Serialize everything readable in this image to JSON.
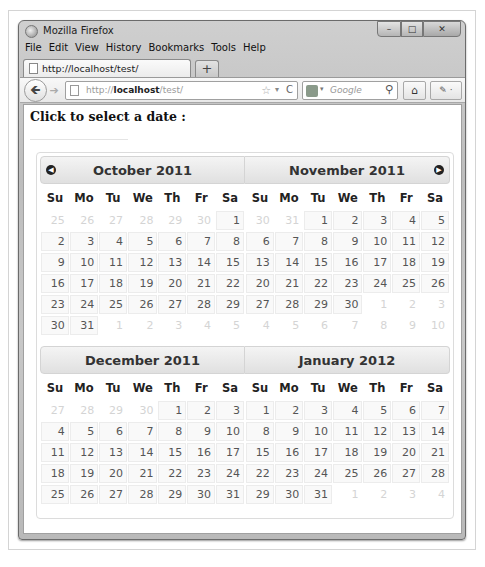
{
  "window": {
    "title": "Mozilla Firefox",
    "controls": {
      "minimize": "–",
      "maximize": "□",
      "close": "✕"
    }
  },
  "menu": [
    {
      "label": "File",
      "accel": "F"
    },
    {
      "label": "Edit",
      "accel": "E"
    },
    {
      "label": "View",
      "accel": "V"
    },
    {
      "label": "History",
      "accel": "s"
    },
    {
      "label": "Bookmarks",
      "accel": "B"
    },
    {
      "label": "Tools",
      "accel": "T"
    },
    {
      "label": "Help",
      "accel": "H"
    }
  ],
  "menu_labels": {
    "file": "File",
    "edit": "Edit",
    "view": "View",
    "history": "History",
    "bookmarks": "Bookmarks",
    "tools": "Tools",
    "help": "Help"
  },
  "tab": {
    "title": "http://localhost/test/",
    "new_tab": "+"
  },
  "navbar": {
    "back": "🡸",
    "forward": "➔",
    "url_prefix": "http://",
    "url_host": "localhost",
    "url_path": "/test/",
    "star": "☆",
    "dropdown": "▾",
    "reload": "C",
    "search_placeholder": "Google",
    "search_dropdown": "▾",
    "search_icon": "⚲",
    "home_icon": "⌂",
    "addon_label": "✎ ·"
  },
  "page": {
    "heading": "Click to select a date :"
  },
  "datepicker": {
    "prev_icon": "◀",
    "next_icon": "▶",
    "weekdays": [
      "Su",
      "Mo",
      "Tu",
      "We",
      "Th",
      "Fr",
      "Sa"
    ],
    "months": [
      {
        "title": "October 2011",
        "weeks": [
          [
            {
              "d": "25",
              "o": true
            },
            {
              "d": "26",
              "o": true
            },
            {
              "d": "27",
              "o": true
            },
            {
              "d": "28",
              "o": true
            },
            {
              "d": "29",
              "o": true
            },
            {
              "d": "30",
              "o": true
            },
            {
              "d": "1"
            }
          ],
          [
            {
              "d": "2"
            },
            {
              "d": "3"
            },
            {
              "d": "4"
            },
            {
              "d": "5"
            },
            {
              "d": "6"
            },
            {
              "d": "7"
            },
            {
              "d": "8"
            }
          ],
          [
            {
              "d": "9"
            },
            {
              "d": "10"
            },
            {
              "d": "11"
            },
            {
              "d": "12"
            },
            {
              "d": "13"
            },
            {
              "d": "14"
            },
            {
              "d": "15"
            }
          ],
          [
            {
              "d": "16"
            },
            {
              "d": "17"
            },
            {
              "d": "18"
            },
            {
              "d": "19"
            },
            {
              "d": "20"
            },
            {
              "d": "21"
            },
            {
              "d": "22"
            }
          ],
          [
            {
              "d": "23"
            },
            {
              "d": "24"
            },
            {
              "d": "25"
            },
            {
              "d": "26"
            },
            {
              "d": "27"
            },
            {
              "d": "28"
            },
            {
              "d": "29"
            }
          ],
          [
            {
              "d": "30"
            },
            {
              "d": "31"
            },
            {
              "d": "1",
              "o": true
            },
            {
              "d": "2",
              "o": true
            },
            {
              "d": "3",
              "o": true
            },
            {
              "d": "4",
              "o": true
            },
            {
              "d": "5",
              "o": true
            }
          ]
        ]
      },
      {
        "title": "November 2011",
        "weeks": [
          [
            {
              "d": "30",
              "o": true
            },
            {
              "d": "31",
              "o": true
            },
            {
              "d": "1"
            },
            {
              "d": "2"
            },
            {
              "d": "3"
            },
            {
              "d": "4"
            },
            {
              "d": "5"
            }
          ],
          [
            {
              "d": "6"
            },
            {
              "d": "7"
            },
            {
              "d": "8"
            },
            {
              "d": "9"
            },
            {
              "d": "10"
            },
            {
              "d": "11"
            },
            {
              "d": "12"
            }
          ],
          [
            {
              "d": "13"
            },
            {
              "d": "14"
            },
            {
              "d": "15"
            },
            {
              "d": "16"
            },
            {
              "d": "17"
            },
            {
              "d": "18"
            },
            {
              "d": "19"
            }
          ],
          [
            {
              "d": "20"
            },
            {
              "d": "21"
            },
            {
              "d": "22"
            },
            {
              "d": "23"
            },
            {
              "d": "24"
            },
            {
              "d": "25"
            },
            {
              "d": "26"
            }
          ],
          [
            {
              "d": "27"
            },
            {
              "d": "28"
            },
            {
              "d": "29"
            },
            {
              "d": "30"
            },
            {
              "d": "1",
              "o": true
            },
            {
              "d": "2",
              "o": true
            },
            {
              "d": "3",
              "o": true
            }
          ],
          [
            {
              "d": "4",
              "o": true
            },
            {
              "d": "5",
              "o": true
            },
            {
              "d": "6",
              "o": true
            },
            {
              "d": "7",
              "o": true
            },
            {
              "d": "8",
              "o": true
            },
            {
              "d": "9",
              "o": true
            },
            {
              "d": "10",
              "o": true
            }
          ]
        ]
      },
      {
        "title": "December 2011",
        "weeks": [
          [
            {
              "d": "27",
              "o": true
            },
            {
              "d": "28",
              "o": true
            },
            {
              "d": "29",
              "o": true
            },
            {
              "d": "30",
              "o": true
            },
            {
              "d": "1"
            },
            {
              "d": "2"
            },
            {
              "d": "3"
            }
          ],
          [
            {
              "d": "4"
            },
            {
              "d": "5"
            },
            {
              "d": "6"
            },
            {
              "d": "7"
            },
            {
              "d": "8"
            },
            {
              "d": "9"
            },
            {
              "d": "10"
            }
          ],
          [
            {
              "d": "11"
            },
            {
              "d": "12"
            },
            {
              "d": "13"
            },
            {
              "d": "14"
            },
            {
              "d": "15"
            },
            {
              "d": "16"
            },
            {
              "d": "17"
            }
          ],
          [
            {
              "d": "18"
            },
            {
              "d": "19"
            },
            {
              "d": "20"
            },
            {
              "d": "21"
            },
            {
              "d": "22"
            },
            {
              "d": "23"
            },
            {
              "d": "24"
            }
          ],
          [
            {
              "d": "25"
            },
            {
              "d": "26"
            },
            {
              "d": "27"
            },
            {
              "d": "28"
            },
            {
              "d": "29"
            },
            {
              "d": "30"
            },
            {
              "d": "31"
            }
          ]
        ]
      },
      {
        "title": "January 2012",
        "weeks": [
          [
            {
              "d": "1"
            },
            {
              "d": "2"
            },
            {
              "d": "3"
            },
            {
              "d": "4"
            },
            {
              "d": "5"
            },
            {
              "d": "6"
            },
            {
              "d": "7"
            }
          ],
          [
            {
              "d": "8"
            },
            {
              "d": "9"
            },
            {
              "d": "10"
            },
            {
              "d": "11"
            },
            {
              "d": "12"
            },
            {
              "d": "13"
            },
            {
              "d": "14"
            }
          ],
          [
            {
              "d": "15"
            },
            {
              "d": "16"
            },
            {
              "d": "17"
            },
            {
              "d": "18"
            },
            {
              "d": "19"
            },
            {
              "d": "20"
            },
            {
              "d": "21"
            }
          ],
          [
            {
              "d": "22"
            },
            {
              "d": "23"
            },
            {
              "d": "24"
            },
            {
              "d": "25"
            },
            {
              "d": "26"
            },
            {
              "d": "27"
            },
            {
              "d": "28"
            }
          ],
          [
            {
              "d": "29"
            },
            {
              "d": "30"
            },
            {
              "d": "31"
            },
            {
              "d": "1",
              "o": true
            },
            {
              "d": "2",
              "o": true
            },
            {
              "d": "3",
              "o": true
            },
            {
              "d": "4",
              "o": true
            }
          ]
        ]
      }
    ]
  }
}
